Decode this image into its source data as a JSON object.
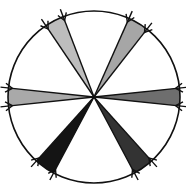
{
  "diagram": {
    "type": "ray-convergence-circle",
    "center": [
      94,
      97
    ],
    "radius": 86,
    "circle_stroke": "#111111",
    "wedges": [
      {
        "name": "top-left",
        "angles": [
          -124,
          -111
        ],
        "fill": "#bdbdbd"
      },
      {
        "name": "top-right",
        "angles": [
          -66,
          -52
        ],
        "fill": "#a6a6a6"
      },
      {
        "name": "left",
        "angles": [
          174,
          186
        ],
        "fill": "#a9a9a9"
      },
      {
        "name": "right",
        "angles": [
          -6,
          6
        ],
        "fill": "#6e6e6e"
      },
      {
        "name": "bottom-left",
        "angles": [
          118,
          132
        ],
        "fill": "#141414"
      },
      {
        "name": "bottom-right",
        "angles": [
          48,
          62
        ],
        "fill": "#333333"
      }
    ],
    "arrow_color": "#111111"
  }
}
